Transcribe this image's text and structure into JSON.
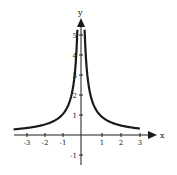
{
  "chart_data": {
    "type": "line",
    "title": "",
    "function": "y = 1/|x|",
    "xlabel": "x",
    "ylabel": "y",
    "xlim": [
      -3.5,
      3.5
    ],
    "ylim": [
      -1.5,
      5.5
    ],
    "xticks": [
      -3,
      -2,
      -1,
      1,
      2,
      3
    ],
    "yticks": [
      -1,
      1,
      2,
      3,
      4,
      5
    ],
    "grid": false,
    "legend": "none",
    "series": [
      {
        "name": "y = 1/|x|",
        "x": [
          -3.5,
          -3,
          -2,
          -1,
          -0.5,
          -0.3,
          -0.2,
          0.2,
          0.3,
          0.5,
          1,
          2,
          3,
          3.1
        ],
        "y": [
          0.29,
          0.33,
          0.5,
          1,
          2,
          3.33,
          5,
          5,
          3.33,
          2,
          1,
          0.5,
          0.33,
          0.32
        ]
      }
    ]
  },
  "axes": {
    "x_label": "x",
    "y_label": "y",
    "x_tick_labels": [
      "-3",
      "-2",
      "-1",
      "1",
      "2",
      "3"
    ],
    "y_tick_labels": [
      "-1",
      "1",
      "2",
      "3",
      "4",
      "5"
    ]
  },
  "colors": {
    "curve": "#1a1a1a",
    "axes": "#1a1a1a",
    "background": "#ffffff"
  }
}
